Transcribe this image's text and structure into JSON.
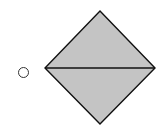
{
  "question_option": {
    "selected": false,
    "figure": {
      "shape": "diamond-split-horizontal",
      "fill_color": "#c4c4c4",
      "stroke_color": "#111111",
      "points": {
        "top": [
          100,
          11
        ],
        "left": [
          45,
          68
        ],
        "right": [
          155,
          68
        ],
        "bottom": [
          100,
          124
        ]
      }
    }
  }
}
